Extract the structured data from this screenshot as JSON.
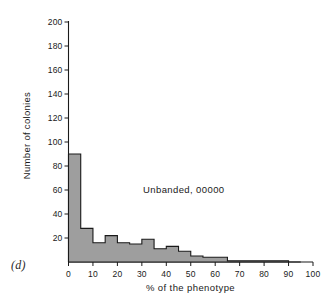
{
  "figure": {
    "panel_label": "(d)",
    "annotation": "Unbanded, 00000"
  },
  "chart_data": {
    "type": "bar",
    "title": "",
    "subtitle": "",
    "annotation": "Unbanded, 00000",
    "panel_label": "(d)",
    "xlabel": "% of the phenotype",
    "ylabel": "Number of colonies",
    "xlim": [
      0,
      100
    ],
    "ylim": [
      0,
      200
    ],
    "xticks": [
      0,
      10,
      20,
      30,
      40,
      50,
      60,
      70,
      80,
      90,
      100
    ],
    "yticks": [
      0,
      20,
      40,
      60,
      80,
      100,
      120,
      140,
      160,
      180,
      200
    ],
    "xtick_labels": [
      "0",
      "10",
      "20",
      "30",
      "40",
      "50",
      "60",
      "70",
      "80",
      "90",
      "100"
    ],
    "ytick_labels": [
      "0",
      "20",
      "40",
      "60",
      "80",
      "100",
      "120",
      "140",
      "160",
      "180",
      "200"
    ],
    "grid": false,
    "legend": false,
    "bin_width": 5,
    "bin_starts": [
      0,
      5,
      10,
      15,
      20,
      25,
      30,
      35,
      40,
      45,
      50,
      55,
      60,
      65,
      70,
      75,
      80,
      85,
      90
    ],
    "categories": [
      "0-5",
      "5-10",
      "10-15",
      "15-20",
      "20-25",
      "25-30",
      "30-35",
      "35-40",
      "40-45",
      "45-50",
      "50-55",
      "55-60",
      "60-65",
      "65-70",
      "70-75",
      "75-80",
      "80-85",
      "85-90",
      "90-95"
    ],
    "values": [
      90,
      28,
      16,
      22,
      16,
      15,
      19,
      11,
      13,
      9,
      5,
      4,
      4,
      1,
      1,
      1,
      1,
      1,
      0
    ],
    "bar_fill_color": "#9e9e9e",
    "bar_edge_color": "#1a1a1a",
    "axis_color": "#1a1a1a"
  }
}
